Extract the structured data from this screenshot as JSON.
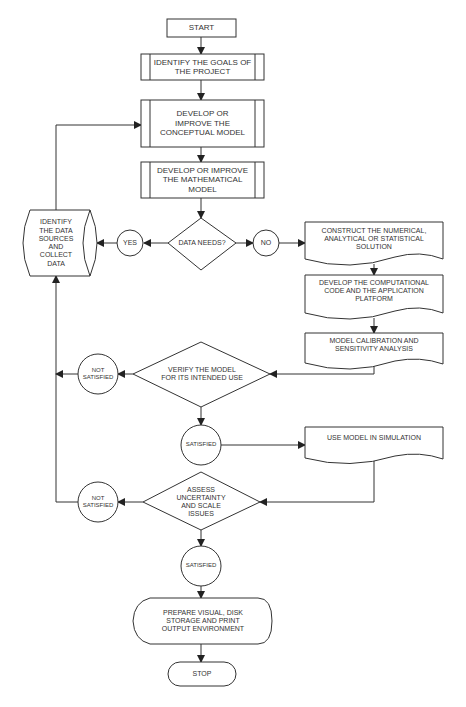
{
  "diagram": {
    "type": "flowchart",
    "nodes": {
      "start": "START",
      "goals": "IDENTIFY THE GOALS OF\nTHE PROJECT",
      "conceptual": "DEVELOP OR\nIMPROVE THE\nCONCEPTUAL MODEL",
      "mathematical": "DEVELOP OR IMPROVE\nTHE MATHEMATICAL\nMODEL",
      "data_needs": "DATA NEEDS?",
      "yes": "YES",
      "no": "NO",
      "data_sources": "IDENTIFY\nTHE DATA\nSOURCES\nAND\nCOLLECT\nDATA",
      "construct": "CONSTRUCT THE NUMERICAL,\nANALYTICAL OR STATISTICAL\nSOLUTION",
      "computational": "DEVELOP THE COMPUTATIONAL\nCODE AND THE APPLICATION\nPLATFORM",
      "calibration": "MODEL CALIBRATION AND\nSENSITIVITY ANALYSIS",
      "verify": "VERIFY THE MODEL\nFOR ITS INTENDED USE",
      "not_satisfied_1": "NOT\nSATISFIED",
      "satisfied_1": "SATISFIED",
      "simulation": "USE MODEL IN SIMULATION",
      "assess": "ASSESS\nUNCERTAINTY\nAND SCALE\nISSUES",
      "not_satisfied_2": "NOT\nSATISFIED",
      "satisfied_2": "SATISFIED",
      "prepare": "PREPARE VISUAL, DISK\nSTORAGE AND PRINT\nOUTPUT ENVIRONMENT",
      "stop": "STOP"
    },
    "edges": [
      [
        "start",
        "goals"
      ],
      [
        "goals",
        "conceptual"
      ],
      [
        "conceptual",
        "mathematical"
      ],
      [
        "mathematical",
        "data_needs"
      ],
      [
        "data_needs",
        "yes"
      ],
      [
        "yes",
        "data_sources"
      ],
      [
        "data_sources",
        "conceptual"
      ],
      [
        "data_needs",
        "no"
      ],
      [
        "no",
        "construct"
      ],
      [
        "construct",
        "computational"
      ],
      [
        "computational",
        "calibration"
      ],
      [
        "calibration",
        "verify"
      ],
      [
        "verify",
        "not_satisfied_1"
      ],
      [
        "not_satisfied_1",
        "data_sources"
      ],
      [
        "verify",
        "satisfied_1"
      ],
      [
        "satisfied_1",
        "simulation"
      ],
      [
        "simulation",
        "assess"
      ],
      [
        "assess",
        "not_satisfied_2"
      ],
      [
        "not_satisfied_2",
        "data_sources"
      ],
      [
        "assess",
        "satisfied_2"
      ],
      [
        "satisfied_2",
        "prepare"
      ],
      [
        "prepare",
        "stop"
      ]
    ]
  }
}
